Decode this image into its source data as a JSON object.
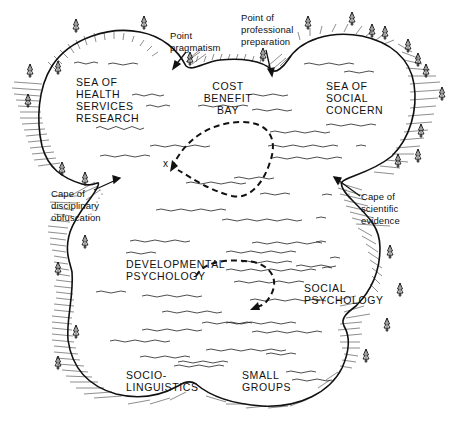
{
  "colors": {
    "ink": "#111111",
    "background": "#ffffff"
  },
  "seas": {
    "health_services": "SEA OF\nHEALTH\nSERVICES\nRESEARCH",
    "social_concern": "SEA OF\nSOCIAL\nCONCERN",
    "cost_benefit_bay": "COST\nBENEFIT\nBAY"
  },
  "regions": {
    "developmental_psychology": "DEVELOPMENTAL\nPSYCHOLOGY",
    "social_psychology": "SOCIAL\nPSYCHOLOGY",
    "sociolinguistics": "SOCIO-\nLINGUISTICS",
    "small_groups": "SMALL\nGROUPS"
  },
  "landmarks": {
    "point_pragmatism": "Point\npragmatism",
    "point_professional_preparation": "Point of\nprofessional\npreparation",
    "cape_disciplinary_obfuscation": "Cape of\ndisciplinary\nobfuscation",
    "cape_scientific_evidence": "Cape of\nscientific\nevidence"
  },
  "markers": {
    "x_mark": "x"
  },
  "icons": [
    "pine-tree-icon",
    "arrow-icon",
    "dashed-route",
    "wave-line"
  ]
}
